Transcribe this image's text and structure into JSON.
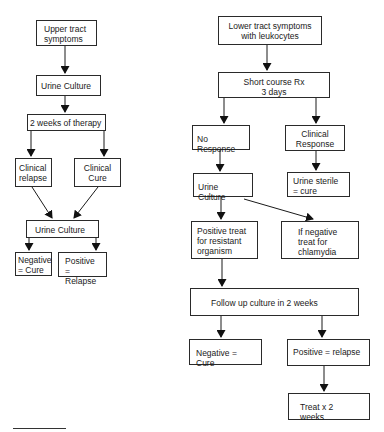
{
  "diagram": {
    "left_flow": {
      "upper_tract": "Upper tract\nsymptoms",
      "urine_culture_1": "Urine Culture",
      "therapy": "2 weeks of therapy",
      "clinical_relapse": "Clinical\nrelapse",
      "clinical_cure": "Clinical\nCure",
      "urine_culture_2": "Urine Culture",
      "negative": "Negative\n= Cure",
      "positive": "Positive\n= Relapse"
    },
    "right_flow": {
      "lower_tract": "Lower tract symptoms\nwith leukocytes",
      "short_course": "Short course Rx\n3 days",
      "no_response": "No Response",
      "clinical_response": "Clinical\nResponse",
      "urine_culture": "Urine Culture",
      "urine_sterile": "Urine sterile\n= cure",
      "positive_treat": "Positive treat\nfor resistant\norganism",
      "negative_treat": "If negative\ntreat for\nchlamydia",
      "follow_up": "Follow up culture in 2 weeks",
      "negative_cure": "Negative = Cure",
      "positive_relapse": "Positive = relapse",
      "treat_2_weeks": "Treat x 2 weeks"
    },
    "colors": {
      "line": "#1a1a1a",
      "box_border": "#2a2a2a",
      "background": "#ffffff"
    }
  }
}
